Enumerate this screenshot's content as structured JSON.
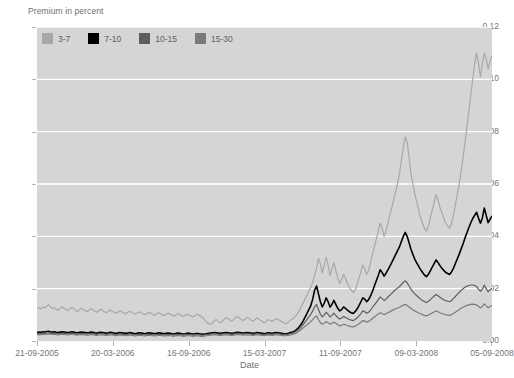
{
  "chart_data": {
    "type": "line",
    "title": "",
    "ylabel": "Premium in percent",
    "xlabel": "Date",
    "ylim": [
      0,
      0.12
    ],
    "ytick_labels": [
      "0.00",
      "0.02",
      "0.04",
      "0.06",
      "0.08",
      "0.10",
      "0.12"
    ],
    "ytick_values": [
      0,
      0.02,
      0.04,
      0.06,
      0.08,
      0.1,
      0.12
    ],
    "xtick_labels": [
      "21-09-2005",
      "20-03-2006",
      "16-09-2006",
      "15-03-2007",
      "11-09-2007",
      "09-03-2008",
      "05-09-2008"
    ],
    "xtick_positions": [
      0,
      0.1667,
      0.3333,
      0.5,
      0.6667,
      0.8333,
      1.0
    ],
    "grid": "horizontal-white",
    "legend_position": "top-left-inside",
    "plot_background": "#d5d5d5",
    "series": [
      {
        "name": "3-7",
        "color": "#a8a8a8",
        "values": [
          0.0125,
          0.0128,
          0.0122,
          0.013,
          0.0126,
          0.0133,
          0.0138,
          0.013,
          0.0124,
          0.0127,
          0.0121,
          0.0118,
          0.0124,
          0.013,
          0.0126,
          0.012,
          0.0116,
          0.0122,
          0.0128,
          0.0124,
          0.0118,
          0.0113,
          0.0119,
          0.0125,
          0.0121,
          0.0116,
          0.0112,
          0.0118,
          0.0124,
          0.0119,
          0.0114,
          0.011,
          0.0116,
          0.0121,
          0.0117,
          0.0112,
          0.0108,
          0.0113,
          0.0118,
          0.0114,
          0.011,
          0.0106,
          0.0111,
          0.0116,
          0.0112,
          0.0108,
          0.0104,
          0.0109,
          0.0114,
          0.011,
          0.0106,
          0.0102,
          0.0107,
          0.0112,
          0.0108,
          0.0104,
          0.01,
          0.0105,
          0.011,
          0.0106,
          0.0102,
          0.0098,
          0.0103,
          0.0108,
          0.0104,
          0.01,
          0.0097,
          0.0102,
          0.0107,
          0.0103,
          0.0099,
          0.0095,
          0.01,
          0.0105,
          0.0101,
          0.0097,
          0.0093,
          0.0098,
          0.0103,
          0.0099,
          0.0095,
          0.0092,
          0.0097,
          0.0102,
          0.0098,
          0.0094,
          0.009,
          0.008,
          0.0072,
          0.0066,
          0.0064,
          0.007,
          0.0078,
          0.0082,
          0.0076,
          0.007,
          0.0074,
          0.0082,
          0.009,
          0.0086,
          0.008,
          0.0076,
          0.0082,
          0.009,
          0.0094,
          0.0088,
          0.0082,
          0.0078,
          0.0084,
          0.009,
          0.0086,
          0.008,
          0.0076,
          0.0082,
          0.0088,
          0.0084,
          0.0078,
          0.0074,
          0.007,
          0.0076,
          0.0082,
          0.0078,
          0.0074,
          0.008,
          0.0086,
          0.0082,
          0.0078,
          0.0074,
          0.007,
          0.0066,
          0.007,
          0.0076,
          0.0082,
          0.0086,
          0.0094,
          0.0104,
          0.0116,
          0.013,
          0.0145,
          0.016,
          0.0175,
          0.019,
          0.0205,
          0.0225,
          0.025,
          0.028,
          0.0315,
          0.0295,
          0.026,
          0.029,
          0.032,
          0.029,
          0.025,
          0.0275,
          0.03,
          0.027,
          0.024,
          0.022,
          0.0235,
          0.0255,
          0.024,
          0.022,
          0.0205,
          0.0195,
          0.0185,
          0.0195,
          0.0215,
          0.024,
          0.0265,
          0.029,
          0.0275,
          0.0255,
          0.027,
          0.03,
          0.033,
          0.036,
          0.039,
          0.042,
          0.045,
          0.043,
          0.04,
          0.042,
          0.045,
          0.048,
          0.051,
          0.054,
          0.057,
          0.06,
          0.064,
          0.069,
          0.074,
          0.078,
          0.076,
          0.07,
          0.064,
          0.06,
          0.056,
          0.053,
          0.05,
          0.047,
          0.045,
          0.043,
          0.042,
          0.044,
          0.047,
          0.05,
          0.053,
          0.056,
          0.054,
          0.051,
          0.049,
          0.047,
          0.045,
          0.044,
          0.043,
          0.045,
          0.048,
          0.052,
          0.056,
          0.06,
          0.065,
          0.07,
          0.076,
          0.082,
          0.088,
          0.094,
          0.1,
          0.106,
          0.11,
          0.106,
          0.101,
          0.106,
          0.11,
          0.108,
          0.104,
          0.107,
          0.109
        ]
      },
      {
        "name": "7-10",
        "color": "#000000",
        "values": [
          0.0032,
          0.0034,
          0.0033,
          0.0035,
          0.0034,
          0.0036,
          0.0037,
          0.0035,
          0.0034,
          0.0035,
          0.0033,
          0.0032,
          0.0034,
          0.0035,
          0.0034,
          0.0033,
          0.0032,
          0.0033,
          0.0035,
          0.0034,
          0.0032,
          0.0031,
          0.0033,
          0.0034,
          0.0033,
          0.0032,
          0.0031,
          0.0032,
          0.0034,
          0.0033,
          0.0031,
          0.003,
          0.0032,
          0.0033,
          0.0032,
          0.0031,
          0.003,
          0.0031,
          0.0033,
          0.0032,
          0.003,
          0.0029,
          0.0031,
          0.0032,
          0.0031,
          0.003,
          0.0029,
          0.003,
          0.0032,
          0.0031,
          0.0029,
          0.0028,
          0.003,
          0.0031,
          0.003,
          0.0029,
          0.0028,
          0.003,
          0.0031,
          0.003,
          0.0029,
          0.0028,
          0.0029,
          0.0031,
          0.003,
          0.0029,
          0.0028,
          0.0029,
          0.003,
          0.0029,
          0.0028,
          0.0027,
          0.0029,
          0.003,
          0.0029,
          0.0028,
          0.0027,
          0.0028,
          0.003,
          0.0029,
          0.0028,
          0.0027,
          0.0028,
          0.0029,
          0.0028,
          0.0027,
          0.0026,
          0.0027,
          0.0028,
          0.0029,
          0.003,
          0.0031,
          0.0032,
          0.0031,
          0.003,
          0.0029,
          0.003,
          0.0031,
          0.0032,
          0.0031,
          0.003,
          0.0029,
          0.003,
          0.0032,
          0.0033,
          0.0032,
          0.0031,
          0.003,
          0.0031,
          0.0032,
          0.0031,
          0.003,
          0.0029,
          0.003,
          0.0032,
          0.0031,
          0.003,
          0.0029,
          0.0028,
          0.003,
          0.0031,
          0.003,
          0.0029,
          0.0031,
          0.0032,
          0.0031,
          0.003,
          0.0029,
          0.0028,
          0.0027,
          0.0029,
          0.0031,
          0.0033,
          0.0035,
          0.004,
          0.0046,
          0.0054,
          0.0064,
          0.0076,
          0.009,
          0.0105,
          0.012,
          0.0135,
          0.016,
          0.0195,
          0.021,
          0.018,
          0.015,
          0.013,
          0.0145,
          0.0165,
          0.015,
          0.013,
          0.014,
          0.0155,
          0.014,
          0.0125,
          0.0115,
          0.012,
          0.013,
          0.0125,
          0.0118,
          0.0112,
          0.0108,
          0.0105,
          0.0112,
          0.0122,
          0.0135,
          0.015,
          0.0165,
          0.016,
          0.015,
          0.0158,
          0.0172,
          0.019,
          0.021,
          0.023,
          0.025,
          0.0272,
          0.0262,
          0.0248,
          0.0258,
          0.0272,
          0.0285,
          0.03,
          0.0315,
          0.033,
          0.0345,
          0.036,
          0.038,
          0.04,
          0.0415,
          0.04,
          0.0375,
          0.035,
          0.033,
          0.0312,
          0.0298,
          0.0285,
          0.0272,
          0.0262,
          0.0252,
          0.0246,
          0.0255,
          0.0268,
          0.0282,
          0.0296,
          0.031,
          0.03,
          0.0288,
          0.0278,
          0.027,
          0.0262,
          0.0258,
          0.0254,
          0.0264,
          0.0278,
          0.0296,
          0.0314,
          0.0332,
          0.0352,
          0.0372,
          0.0394,
          0.0414,
          0.0434,
          0.0452,
          0.0468,
          0.048,
          0.0492,
          0.047,
          0.045,
          0.047,
          0.0508,
          0.048,
          0.0452,
          0.0466,
          0.0478
        ]
      },
      {
        "name": "10-15",
        "color": "#5e5e5e",
        "values": [
          0.0028,
          0.0029,
          0.0028,
          0.003,
          0.0029,
          0.003,
          0.0031,
          0.003,
          0.0029,
          0.003,
          0.0028,
          0.0027,
          0.0029,
          0.003,
          0.0029,
          0.0028,
          0.0027,
          0.0028,
          0.003,
          0.0029,
          0.0027,
          0.0026,
          0.0028,
          0.0029,
          0.0028,
          0.0027,
          0.0026,
          0.0027,
          0.0029,
          0.0028,
          0.0026,
          0.0025,
          0.0027,
          0.0028,
          0.0027,
          0.0026,
          0.0025,
          0.0026,
          0.0028,
          0.0027,
          0.0025,
          0.0024,
          0.0026,
          0.0027,
          0.0026,
          0.0025,
          0.0024,
          0.0025,
          0.0027,
          0.0026,
          0.0024,
          0.0023,
          0.0025,
          0.0026,
          0.0025,
          0.0024,
          0.0023,
          0.0025,
          0.0026,
          0.0025,
          0.0024,
          0.0023,
          0.0024,
          0.0026,
          0.0025,
          0.0024,
          0.0023,
          0.0024,
          0.0025,
          0.0024,
          0.0023,
          0.0022,
          0.0024,
          0.0025,
          0.0024,
          0.0023,
          0.0022,
          0.0023,
          0.0025,
          0.0024,
          0.0023,
          0.0022,
          0.0023,
          0.0024,
          0.0023,
          0.0022,
          0.0022,
          0.0023,
          0.0024,
          0.0025,
          0.0026,
          0.0027,
          0.0028,
          0.0027,
          0.0026,
          0.0025,
          0.0026,
          0.0027,
          0.0028,
          0.0027,
          0.0026,
          0.0025,
          0.0026,
          0.0028,
          0.0029,
          0.0028,
          0.0027,
          0.0026,
          0.0027,
          0.0028,
          0.0027,
          0.0026,
          0.0025,
          0.0026,
          0.0028,
          0.0027,
          0.0026,
          0.0025,
          0.0024,
          0.0026,
          0.0027,
          0.0026,
          0.0025,
          0.0027,
          0.0028,
          0.0027,
          0.0026,
          0.0025,
          0.0024,
          0.0024,
          0.0025,
          0.0027,
          0.0029,
          0.0031,
          0.0035,
          0.004,
          0.0046,
          0.0054,
          0.0062,
          0.0072,
          0.0082,
          0.0092,
          0.0102,
          0.0115,
          0.013,
          0.014,
          0.012,
          0.0102,
          0.0092,
          0.01,
          0.011,
          0.0102,
          0.0092,
          0.0098,
          0.0106,
          0.0098,
          0.009,
          0.0084,
          0.0088,
          0.0094,
          0.009,
          0.0086,
          0.0082,
          0.008,
          0.0078,
          0.0082,
          0.0088,
          0.0096,
          0.0105,
          0.0115,
          0.0112,
          0.0106,
          0.011,
          0.0118,
          0.0128,
          0.0138,
          0.0148,
          0.0158,
          0.0168,
          0.0162,
          0.0155,
          0.016,
          0.0168,
          0.0175,
          0.0182,
          0.019,
          0.0196,
          0.0202,
          0.0208,
          0.0216,
          0.0224,
          0.023,
          0.0222,
          0.021,
          0.0198,
          0.0188,
          0.018,
          0.0173,
          0.0166,
          0.016,
          0.0155,
          0.015,
          0.0147,
          0.0152,
          0.0158,
          0.0165,
          0.0172,
          0.0178,
          0.0173,
          0.0167,
          0.0162,
          0.0158,
          0.0154,
          0.0152,
          0.015,
          0.0155,
          0.0162,
          0.017,
          0.0178,
          0.0186,
          0.0194,
          0.02,
          0.0206,
          0.021,
          0.0212,
          0.0214,
          0.0214,
          0.0212,
          0.0208,
          0.0198,
          0.019,
          0.0198,
          0.0214,
          0.02,
          0.0188,
          0.0196,
          0.0202
        ]
      },
      {
        "name": "15-30",
        "color": "#7a7a7a",
        "values": [
          0.0024,
          0.0025,
          0.0024,
          0.0026,
          0.0025,
          0.0026,
          0.0027,
          0.0026,
          0.0025,
          0.0026,
          0.0024,
          0.0023,
          0.0025,
          0.0026,
          0.0025,
          0.0024,
          0.0023,
          0.0024,
          0.0026,
          0.0025,
          0.0023,
          0.0022,
          0.0024,
          0.0025,
          0.0024,
          0.0023,
          0.0022,
          0.0023,
          0.0025,
          0.0024,
          0.0022,
          0.0021,
          0.0023,
          0.0024,
          0.0023,
          0.0022,
          0.0021,
          0.0022,
          0.0024,
          0.0023,
          0.0021,
          0.002,
          0.0022,
          0.0023,
          0.0022,
          0.0021,
          0.002,
          0.0021,
          0.0023,
          0.0022,
          0.002,
          0.0019,
          0.0021,
          0.0022,
          0.0021,
          0.002,
          0.0019,
          0.0021,
          0.0022,
          0.0021,
          0.002,
          0.0019,
          0.002,
          0.0022,
          0.0021,
          0.002,
          0.0019,
          0.002,
          0.0021,
          0.002,
          0.0019,
          0.0018,
          0.002,
          0.0021,
          0.002,
          0.0019,
          0.0018,
          0.0019,
          0.0021,
          0.002,
          0.0019,
          0.0018,
          0.0019,
          0.002,
          0.0019,
          0.0018,
          0.0018,
          0.0019,
          0.002,
          0.0021,
          0.0022,
          0.0023,
          0.0024,
          0.0023,
          0.0022,
          0.0021,
          0.0022,
          0.0023,
          0.0024,
          0.0023,
          0.0022,
          0.0021,
          0.0022,
          0.0024,
          0.0025,
          0.0024,
          0.0023,
          0.0022,
          0.0023,
          0.0024,
          0.0023,
          0.0022,
          0.0021,
          0.0022,
          0.0024,
          0.0023,
          0.0022,
          0.0021,
          0.002,
          0.0022,
          0.0023,
          0.0022,
          0.0021,
          0.0023,
          0.0024,
          0.0023,
          0.0022,
          0.0021,
          0.002,
          0.002,
          0.0021,
          0.0022,
          0.0024,
          0.0026,
          0.0029,
          0.0033,
          0.0038,
          0.0044,
          0.005,
          0.0056,
          0.0062,
          0.0068,
          0.0074,
          0.0082,
          0.009,
          0.0096,
          0.0082,
          0.007,
          0.0064,
          0.0068,
          0.0074,
          0.007,
          0.0064,
          0.0068,
          0.0072,
          0.0068,
          0.0062,
          0.0058,
          0.006,
          0.0064,
          0.0062,
          0.0059,
          0.0057,
          0.0055,
          0.0054,
          0.0057,
          0.0061,
          0.0066,
          0.0072,
          0.0078,
          0.0076,
          0.0072,
          0.0075,
          0.008,
          0.0086,
          0.0092,
          0.0098,
          0.0103,
          0.0108,
          0.0105,
          0.0101,
          0.0104,
          0.0108,
          0.0112,
          0.0116,
          0.012,
          0.0123,
          0.0126,
          0.0129,
          0.0133,
          0.0137,
          0.014,
          0.0136,
          0.013,
          0.0124,
          0.0119,
          0.0115,
          0.0111,
          0.0107,
          0.0104,
          0.0101,
          0.0098,
          0.0096,
          0.0099,
          0.0103,
          0.0107,
          0.0111,
          0.0115,
          0.0112,
          0.0108,
          0.0105,
          0.0103,
          0.01,
          0.0099,
          0.0098,
          0.0101,
          0.0105,
          0.011,
          0.0115,
          0.012,
          0.0125,
          0.0129,
          0.0133,
          0.0136,
          0.0138,
          0.014,
          0.0141,
          0.014,
          0.0138,
          0.0132,
          0.0127,
          0.0132,
          0.0142,
          0.0134,
          0.0127,
          0.0132,
          0.0136
        ]
      }
    ]
  },
  "legend": {
    "entries": [
      {
        "label": "3-7",
        "color": "#a8a8a8"
      },
      {
        "label": "7-10",
        "color": "#000000"
      },
      {
        "label": "10-15",
        "color": "#5e5e5e"
      },
      {
        "label": "15-30",
        "color": "#7a7a7a"
      }
    ]
  }
}
